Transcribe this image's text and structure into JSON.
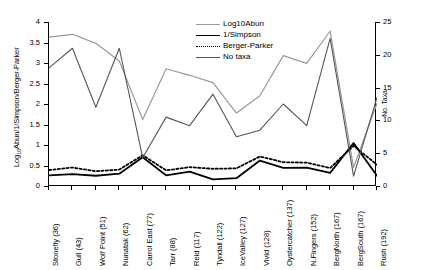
{
  "chart_data": {
    "type": "line",
    "title": "",
    "xlabel": "",
    "ylabel": "Log10Abun/1/Simpson/Berger-Parker",
    "ylabel_secondary": "No. Taxa",
    "ylim": [
      0,
      4
    ],
    "ylim_secondary": [
      0,
      25
    ],
    "yticks": [
      "0",
      "0.5",
      "1",
      "1.5",
      "2",
      "2.5",
      "3",
      "3.5",
      "4"
    ],
    "yticks_secondary": [
      "0",
      "5",
      "10",
      "15",
      "20",
      "25"
    ],
    "grid": false,
    "legend_position": "top-right",
    "categories": [
      "Stonefly  (36)",
      "Gull  (43)",
      "Wolf Point  (51)",
      "Nunatak  (62)",
      "Carrol East  (77)",
      "Tarr  (88)",
      "Reid  (117)",
      "Tyndall  (122)",
      "IceValley  (127)",
      "Vivid  (128)",
      "Oystercatcher  (137)",
      "N.Fingers  (152)",
      "BergNorth  (167)",
      "BergSouth  (167)",
      "Rush  (192)"
    ],
    "category_names": [
      "Stonefly",
      "Gull",
      "Wolf Point",
      "Nunatak",
      "Carrol East",
      "Tarr",
      "Reid",
      "Tyndall",
      "IceValley",
      "Vivid",
      "Oystercatcher",
      "N.Fingers",
      "BergNorth",
      "BergSouth",
      "Rush"
    ],
    "category_ages": [
      36,
      43,
      51,
      62,
      77,
      88,
      117,
      122,
      127,
      128,
      137,
      152,
      167,
      167,
      192
    ],
    "series": [
      {
        "name": "Log10Abun",
        "axis": "left",
        "color": "#9a9a9a",
        "style": "solid",
        "width": 1.2,
        "values": [
          3.63,
          3.7,
          3.48,
          3.05,
          1.62,
          2.86,
          2.7,
          2.52,
          1.78,
          2.2,
          3.18,
          2.99,
          3.78,
          0.45,
          2.02
        ]
      },
      {
        "name": "1/Simpson",
        "axis": "left",
        "color": "#000000",
        "style": "solid",
        "width": 1.8,
        "values": [
          0.26,
          0.29,
          0.25,
          0.3,
          0.7,
          0.26,
          0.35,
          0.16,
          0.19,
          0.62,
          0.44,
          0.45,
          0.32,
          1.05,
          0.25
        ]
      },
      {
        "name": "Berger-Parker",
        "axis": "left",
        "color": "#000000",
        "style": "dotted",
        "width": 1.8,
        "values": [
          0.39,
          0.45,
          0.36,
          0.4,
          0.75,
          0.38,
          0.46,
          0.42,
          0.43,
          0.72,
          0.58,
          0.57,
          0.44,
          0.98,
          0.52
        ]
      },
      {
        "name": "No taxa",
        "axis": "right",
        "color": "#555555",
        "style": "solid",
        "width": 1.1,
        "values": [
          18.0,
          21.0,
          12.0,
          21.0,
          4.3,
          10.5,
          9.2,
          14.0,
          7.5,
          8.5,
          12.5,
          9.2,
          22.5,
          1.5,
          13.5
        ]
      }
    ]
  },
  "legend": {
    "items": [
      {
        "label": "Log10Abun"
      },
      {
        "label": "1/Simpson"
      },
      {
        "label": "Berger-Parker"
      },
      {
        "label": "No taxa"
      }
    ]
  },
  "axes": {
    "left_title_prefix": "Log",
    "left_title_sub": "10",
    "left_title_suffix": "Abun/1/Simpson/Berger-Parker",
    "right_title": "No. Taxa"
  }
}
